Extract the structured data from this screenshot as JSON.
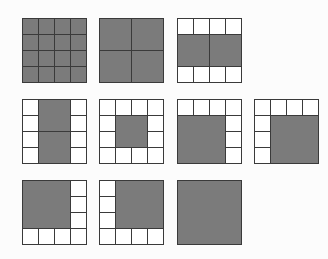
{
  "figure": {
    "colors": {
      "gray_fill": "#7b7b7b",
      "white_fill": "#ffffff",
      "border": "#3a3a3a",
      "background": "#fcfcfc"
    },
    "grid_size": 4,
    "grids": [
      {
        "id": 1,
        "x": 22,
        "y": 18,
        "cells": [
          [
            0,
            0,
            1,
            1,
            "gray"
          ],
          [
            1,
            0,
            1,
            1,
            "gray"
          ],
          [
            2,
            0,
            1,
            1,
            "gray"
          ],
          [
            3,
            0,
            1,
            1,
            "gray"
          ],
          [
            0,
            1,
            1,
            1,
            "gray"
          ],
          [
            1,
            1,
            1,
            1,
            "gray"
          ],
          [
            2,
            1,
            1,
            1,
            "gray"
          ],
          [
            3,
            1,
            1,
            1,
            "gray"
          ],
          [
            0,
            2,
            1,
            1,
            "gray"
          ],
          [
            1,
            2,
            1,
            1,
            "gray"
          ],
          [
            2,
            2,
            1,
            1,
            "gray"
          ],
          [
            3,
            2,
            1,
            1,
            "gray"
          ],
          [
            0,
            3,
            1,
            1,
            "gray"
          ],
          [
            1,
            3,
            1,
            1,
            "gray"
          ],
          [
            2,
            3,
            1,
            1,
            "gray"
          ],
          [
            3,
            3,
            1,
            1,
            "gray"
          ]
        ]
      },
      {
        "id": 2,
        "x": 99,
        "y": 18,
        "cells": [
          [
            0,
            0,
            2,
            2,
            "gray"
          ],
          [
            2,
            0,
            2,
            2,
            "gray"
          ],
          [
            0,
            2,
            2,
            2,
            "gray"
          ],
          [
            2,
            2,
            2,
            2,
            "gray"
          ]
        ]
      },
      {
        "id": 3,
        "x": 177,
        "y": 18,
        "cells": [
          [
            0,
            0,
            1,
            1,
            "white"
          ],
          [
            1,
            0,
            1,
            1,
            "white"
          ],
          [
            2,
            0,
            1,
            1,
            "white"
          ],
          [
            3,
            0,
            1,
            1,
            "white"
          ],
          [
            0,
            1,
            2,
            2,
            "gray"
          ],
          [
            2,
            1,
            2,
            2,
            "gray"
          ],
          [
            0,
            3,
            1,
            1,
            "white"
          ],
          [
            1,
            3,
            1,
            1,
            "white"
          ],
          [
            2,
            3,
            1,
            1,
            "white"
          ],
          [
            3,
            3,
            1,
            1,
            "white"
          ]
        ]
      },
      {
        "id": 4,
        "x": 22,
        "y": 99,
        "cells": [
          [
            0,
            0,
            1,
            1,
            "white"
          ],
          [
            0,
            1,
            1,
            1,
            "white"
          ],
          [
            0,
            2,
            1,
            1,
            "white"
          ],
          [
            0,
            3,
            1,
            1,
            "white"
          ],
          [
            1,
            0,
            2,
            2,
            "gray"
          ],
          [
            1,
            2,
            2,
            2,
            "gray"
          ],
          [
            3,
            0,
            1,
            1,
            "white"
          ],
          [
            3,
            1,
            1,
            1,
            "white"
          ],
          [
            3,
            2,
            1,
            1,
            "white"
          ],
          [
            3,
            3,
            1,
            1,
            "white"
          ]
        ]
      },
      {
        "id": 5,
        "x": 99,
        "y": 99,
        "cells": [
          [
            0,
            0,
            1,
            1,
            "white"
          ],
          [
            1,
            0,
            1,
            1,
            "white"
          ],
          [
            2,
            0,
            1,
            1,
            "white"
          ],
          [
            3,
            0,
            1,
            1,
            "white"
          ],
          [
            0,
            1,
            1,
            1,
            "white"
          ],
          [
            1,
            1,
            2,
            2,
            "gray"
          ],
          [
            3,
            1,
            1,
            1,
            "white"
          ],
          [
            0,
            2,
            1,
            1,
            "white"
          ],
          [
            3,
            2,
            1,
            1,
            "white"
          ],
          [
            0,
            3,
            1,
            1,
            "white"
          ],
          [
            1,
            3,
            1,
            1,
            "white"
          ],
          [
            2,
            3,
            1,
            1,
            "white"
          ],
          [
            3,
            3,
            1,
            1,
            "white"
          ]
        ]
      },
      {
        "id": 6,
        "x": 177,
        "y": 99,
        "cells": [
          [
            0,
            0,
            1,
            1,
            "white"
          ],
          [
            1,
            0,
            1,
            1,
            "white"
          ],
          [
            2,
            0,
            1,
            1,
            "white"
          ],
          [
            3,
            0,
            1,
            1,
            "white"
          ],
          [
            0,
            1,
            3,
            3,
            "gray"
          ],
          [
            3,
            1,
            1,
            1,
            "white"
          ],
          [
            3,
            2,
            1,
            1,
            "white"
          ],
          [
            3,
            3,
            1,
            1,
            "white"
          ]
        ]
      },
      {
        "id": 7,
        "x": 254,
        "y": 99,
        "cells": [
          [
            0,
            0,
            1,
            1,
            "white"
          ],
          [
            1,
            0,
            1,
            1,
            "white"
          ],
          [
            2,
            0,
            1,
            1,
            "white"
          ],
          [
            3,
            0,
            1,
            1,
            "white"
          ],
          [
            0,
            1,
            1,
            1,
            "white"
          ],
          [
            0,
            2,
            1,
            1,
            "white"
          ],
          [
            0,
            3,
            1,
            1,
            "white"
          ],
          [
            1,
            1,
            3,
            3,
            "gray"
          ]
        ]
      },
      {
        "id": 8,
        "x": 22,
        "y": 180,
        "cells": [
          [
            0,
            0,
            3,
            3,
            "gray"
          ],
          [
            3,
            0,
            1,
            1,
            "white"
          ],
          [
            3,
            1,
            1,
            1,
            "white"
          ],
          [
            3,
            2,
            1,
            1,
            "white"
          ],
          [
            0,
            3,
            1,
            1,
            "white"
          ],
          [
            1,
            3,
            1,
            1,
            "white"
          ],
          [
            2,
            3,
            1,
            1,
            "white"
          ],
          [
            3,
            3,
            1,
            1,
            "white"
          ]
        ]
      },
      {
        "id": 9,
        "x": 99,
        "y": 180,
        "cells": [
          [
            0,
            0,
            1,
            1,
            "white"
          ],
          [
            0,
            1,
            1,
            1,
            "white"
          ],
          [
            0,
            2,
            1,
            1,
            "white"
          ],
          [
            1,
            0,
            3,
            3,
            "gray"
          ],
          [
            0,
            3,
            1,
            1,
            "white"
          ],
          [
            1,
            3,
            1,
            1,
            "white"
          ],
          [
            2,
            3,
            1,
            1,
            "white"
          ],
          [
            3,
            3,
            1,
            1,
            "white"
          ]
        ]
      },
      {
        "id": 10,
        "x": 177,
        "y": 180,
        "cells": [
          [
            0,
            0,
            4,
            4,
            "gray"
          ]
        ]
      }
    ]
  }
}
